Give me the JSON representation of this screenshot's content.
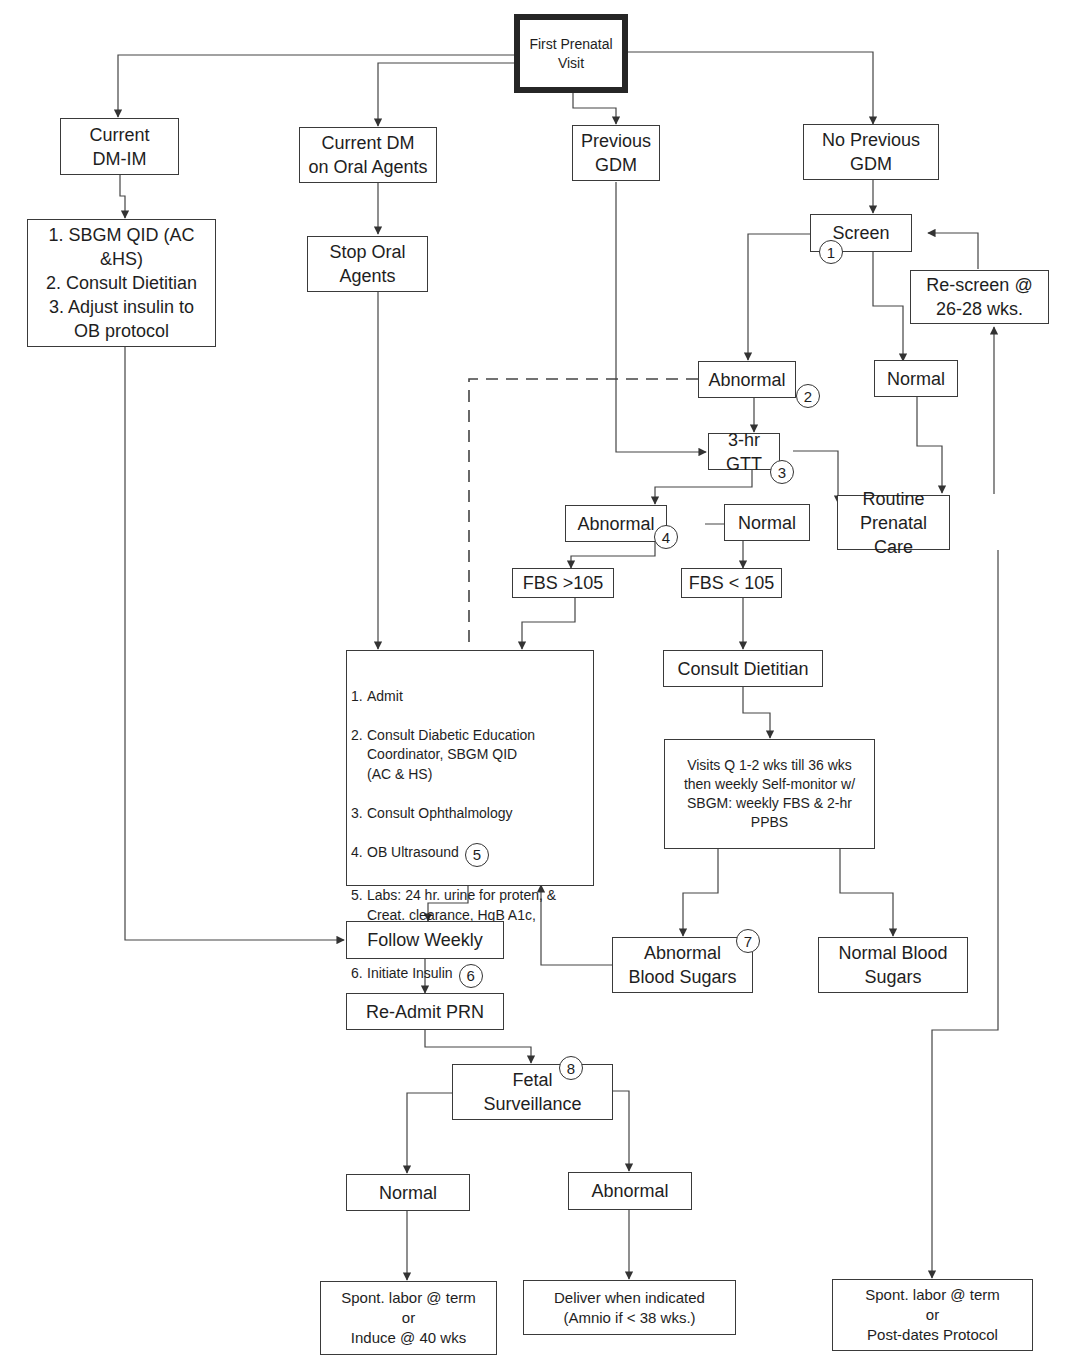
{
  "diagram": {
    "type": "flowchart",
    "colors": {
      "line": "#3a3a3a",
      "text": "#1e1e1e",
      "background": "#ffffff"
    }
  },
  "nodes": {
    "start": {
      "label": "First Prenatal\nVisit"
    },
    "current_dm_im": {
      "label": "Current\nDM-IM"
    },
    "current_dm_oral": {
      "label": "Current DM\non Oral Agents"
    },
    "previous_gdm": {
      "label": "Previous\nGDM"
    },
    "no_previous_gdm": {
      "label": "No Previous\nGDM"
    },
    "dm_im_steps": {
      "label": "1. SBGM QID (AC\n&HS)\n2.  Consult Dietitian\n3.  Adjust insulin to\nOB protocol"
    },
    "stop_oral": {
      "label": "Stop Oral\nAgents"
    },
    "screen": {
      "label": "Screen",
      "badge": "1"
    },
    "rescreen": {
      "label": "Re-screen @\n26-28 wks."
    },
    "screen_abnormal": {
      "label": "Abnormal",
      "badge": "2"
    },
    "screen_normal": {
      "label": "Normal"
    },
    "gtt": {
      "label": "3-hr GTT",
      "badge": "3"
    },
    "gtt_abnormal": {
      "label": "Abnormal",
      "badge": "4"
    },
    "gtt_normal": {
      "label": "Normal"
    },
    "routine_care": {
      "label": "Routine\nPrenatal Care"
    },
    "fbs_high": {
      "label": "FBS >105"
    },
    "fbs_low": {
      "label": "FBS < 105"
    },
    "admit_steps": {
      "items": [
        {
          "num": "1.",
          "text": "Admit"
        },
        {
          "num": "2.",
          "text": "Consult Diabetic Education\nCoordinator, SBGM QID\n(AC & HS)"
        },
        {
          "num": "3.",
          "text": "Consult Ophthalmology"
        },
        {
          "num": "4.",
          "text": "OB Ultrasound",
          "badge": "5"
        },
        {
          "num": "5.",
          "text": "Labs: 24 hr. urine for proten, &\nCreat. clearance, HgB A1c,\nChem-20"
        },
        {
          "num": "6.",
          "text": " Initiate Insulin",
          "badge": "6"
        }
      ]
    },
    "consult_dietitian": {
      "label": "Consult Dietitian"
    },
    "visits": {
      "label": "Visits Q 1-2 wks till 36 wks\nthen weekly Self-monitor w/\nSBGM:  weekly FBS & 2-hr\nPPBS"
    },
    "abnormal_sugars": {
      "label": "Abnormal\nBlood Sugars",
      "badge": "7"
    },
    "normal_sugars": {
      "label": "Normal Blood\nSugars"
    },
    "follow_weekly": {
      "label": "Follow Weekly"
    },
    "readmit": {
      "label": "Re-Admit PRN"
    },
    "fetal": {
      "label": "Fetal\nSurveillance",
      "badge": "8"
    },
    "fetal_normal": {
      "label": "Normal"
    },
    "fetal_abnormal": {
      "label": "Abnormal"
    },
    "outcome_normal": {
      "label": "Spont. labor @ term\nor\nInduce @ 40 wks"
    },
    "outcome_abnormal": {
      "label": "Deliver when indicated\n(Amnio if < 38 wks.)"
    },
    "outcome_routine": {
      "label": "Spont. labor @ term\nor\nPost-dates Protocol"
    }
  },
  "edges": [
    {
      "from": "start",
      "to": "current_dm_im"
    },
    {
      "from": "start",
      "to": "current_dm_oral"
    },
    {
      "from": "start",
      "to": "previous_gdm"
    },
    {
      "from": "start",
      "to": "no_previous_gdm"
    },
    {
      "from": "current_dm_im",
      "to": "dm_im_steps"
    },
    {
      "from": "current_dm_oral",
      "to": "stop_oral"
    },
    {
      "from": "no_previous_gdm",
      "to": "screen"
    },
    {
      "from": "screen",
      "to": "screen_abnormal"
    },
    {
      "from": "screen",
      "to": "screen_normal"
    },
    {
      "from": "rescreen",
      "to": "screen"
    },
    {
      "from": "screen_abnormal",
      "to": "gtt"
    },
    {
      "from": "screen_abnormal",
      "to": "admit_steps",
      "style": "dashed"
    },
    {
      "from": "previous_gdm",
      "to": "gtt"
    },
    {
      "from": "screen_normal",
      "to": "routine_care"
    },
    {
      "from": "gtt",
      "to": "gtt_abnormal"
    },
    {
      "from": "gtt",
      "to": "gtt_normal"
    },
    {
      "from": "gtt_normal",
      "to": "routine_care"
    },
    {
      "from": "routine_care",
      "to": "rescreen"
    },
    {
      "from": "gtt_abnormal",
      "to": "fbs_high"
    },
    {
      "from": "gtt_abnormal",
      "to": "fbs_low"
    },
    {
      "from": "fbs_high",
      "to": "admit_steps"
    },
    {
      "from": "stop_oral",
      "to": "admit_steps"
    },
    {
      "from": "fbs_low",
      "to": "consult_dietitian"
    },
    {
      "from": "consult_dietitian",
      "to": "visits"
    },
    {
      "from": "visits",
      "to": "abnormal_sugars"
    },
    {
      "from": "visits",
      "to": "normal_sugars"
    },
    {
      "from": "abnormal_sugars",
      "to": "admit_steps"
    },
    {
      "from": "admit_steps",
      "to": "follow_weekly"
    },
    {
      "from": "dm_im_steps",
      "to": "follow_weekly"
    },
    {
      "from": "follow_weekly",
      "to": "readmit"
    },
    {
      "from": "readmit",
      "to": "fetal"
    },
    {
      "from": "fetal",
      "to": "fetal_normal"
    },
    {
      "from": "fetal",
      "to": "fetal_abnormal"
    },
    {
      "from": "fetal_normal",
      "to": "outcome_normal"
    },
    {
      "from": "fetal_abnormal",
      "to": "outcome_abnormal"
    },
    {
      "from": "routine_care",
      "to": "outcome_routine"
    }
  ]
}
